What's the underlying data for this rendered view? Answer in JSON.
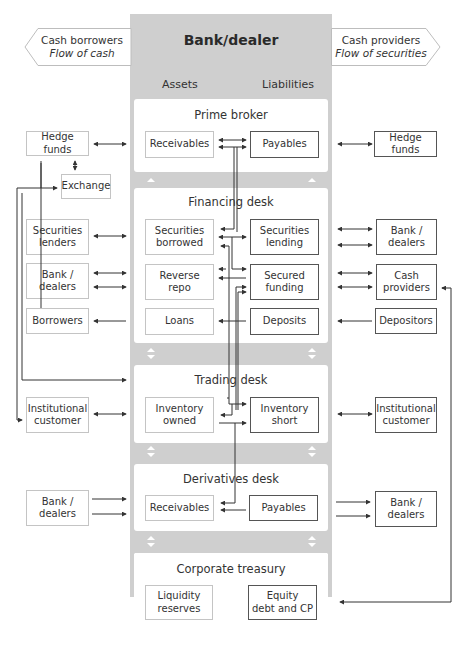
{
  "title": "Bank/dealer",
  "banners": {
    "left": {
      "line1": "Cash borrowers",
      "line2": "Flow of cash"
    },
    "right": {
      "line1": "Cash providers",
      "line2": "Flow of securities"
    }
  },
  "columns": {
    "assets": "Assets",
    "liabilities": "Liabilities"
  },
  "desks": [
    {
      "name": "Prime broker",
      "assets": [
        "Receivables"
      ],
      "liabilities": [
        "Payables"
      ]
    },
    {
      "name": "Financing desk",
      "assets": [
        "Securities borrowed",
        "Reverse repo",
        "Loans"
      ],
      "liabilities": [
        "Securities lending",
        "Secured funding",
        "Deposits"
      ]
    },
    {
      "name": "Trading desk",
      "assets": [
        "Inventory owned"
      ],
      "liabilities": [
        "Inventory short"
      ]
    },
    {
      "name": "Derivatives desk",
      "assets": [
        "Receivables"
      ],
      "liabilities": [
        "Payables"
      ]
    },
    {
      "name": "Corporate treasury",
      "assets": [
        "Liquidity reserves"
      ],
      "liabilities": [
        "Equity debt and CP"
      ]
    }
  ],
  "labels": {
    "pb_rec": "Receivables",
    "pb_pay": "Payables",
    "fd_sb1": "Securities",
    "fd_sb2": "borrowed",
    "fd_sl1": "Securities",
    "fd_sl2": "lending",
    "fd_rr1": "Reverse",
    "fd_rr2": "repo",
    "fd_sf1": "Secured",
    "fd_sf2": "funding",
    "fd_loans": "Loans",
    "fd_dep": "Deposits",
    "td_io1": "Inventory",
    "td_io2": "owned",
    "td_is1": "Inventory",
    "td_is2": "short",
    "dd_rec": "Receivables",
    "dd_pay": "Payables",
    "ct_lr1": "Liquidity",
    "ct_lr2": "reserves",
    "ct_eq1": "Equity",
    "ct_eq2": "debt and CP"
  },
  "left_counterparties": {
    "hedge_funds": "Hedge funds",
    "exchange": "Exchange",
    "sec_lenders1": "Securities",
    "sec_lenders2": "lenders",
    "bank_dealers1": "Bank /",
    "bank_dealers2": "dealers",
    "borrowers": "Borrowers",
    "inst1": "Institutional",
    "inst2": "customer",
    "deriv_bd1": "Bank /",
    "deriv_bd2": "dealers"
  },
  "right_counterparties": {
    "hedge_funds": "Hedge funds",
    "bank_dealers1": "Bank /",
    "bank_dealers2": "dealers",
    "cash_prov1": "Cash",
    "cash_prov2": "providers",
    "depositors": "Depositors",
    "inst1": "Institutional",
    "inst2": "customer",
    "deriv_bd1": "Bank /",
    "deriv_bd2": "dealers"
  },
  "colors": {
    "bank_bg": "#cfcfcf",
    "desk_bg": "#ffffff",
    "line": "#333333",
    "box_border": "#c4c4c4"
  }
}
